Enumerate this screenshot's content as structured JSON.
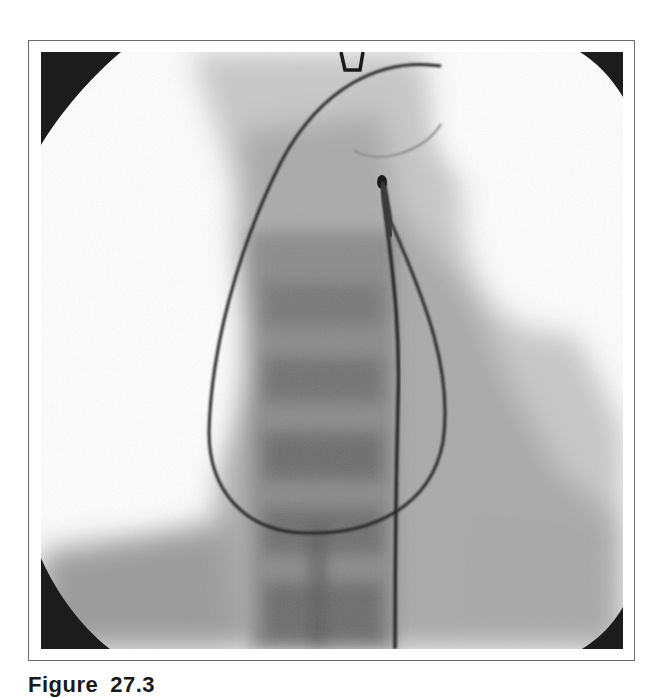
{
  "figure": {
    "type": "fluoroscopy-image",
    "caption": {
      "label": "Figure",
      "number": "27.3"
    },
    "colors": {
      "frame_border": "#6a6a6a",
      "corner_mask": "#1c1c1c",
      "catheter": "#2a2a2a",
      "spine_shadow": "#6f6f6f",
      "background": "#ffffff"
    }
  }
}
